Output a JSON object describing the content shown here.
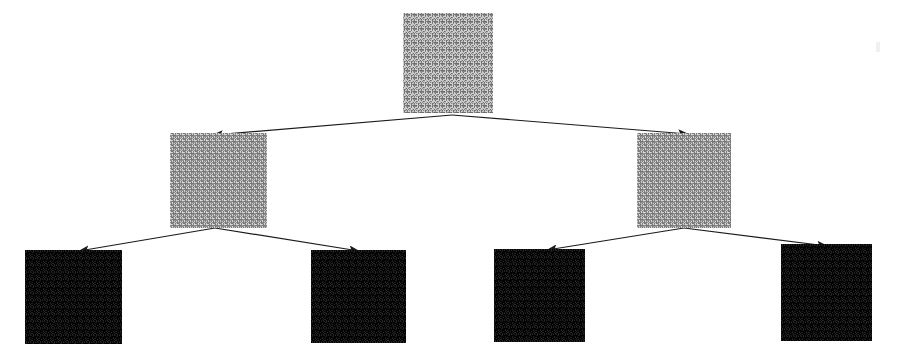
{
  "figure": {
    "kind": "binary-tree-diagram",
    "background_color": "#ffffff",
    "edge_color": "#1a1a1a",
    "canvas": {
      "width": 900,
      "height": 360
    }
  },
  "nodes": [
    {
      "id": "root",
      "role": "root",
      "level": 0,
      "label": "root-patch",
      "texture": "gray-noise",
      "fill_color": "#9a9a9a",
      "x": 403,
      "y": 13,
      "width": 90,
      "height": 100
    },
    {
      "id": "internal-left",
      "role": "internal",
      "level": 1,
      "label": "left-child-patch",
      "texture": "gray-noise",
      "fill_color": "#a6a6a6",
      "x": 170,
      "y": 133,
      "width": 97,
      "height": 95
    },
    {
      "id": "internal-right",
      "role": "internal",
      "level": 1,
      "label": "right-child-patch",
      "texture": "gray-noise",
      "fill_color": "#a6a6a6",
      "x": 637,
      "y": 133,
      "width": 94,
      "height": 95
    },
    {
      "id": "leaf-1",
      "role": "leaf",
      "level": 2,
      "label": "leaf-patch-1",
      "texture": "dark-noise",
      "fill_color": "#0d0d0d",
      "x": 25,
      "y": 250,
      "width": 97,
      "height": 94
    },
    {
      "id": "leaf-2",
      "role": "leaf",
      "level": 2,
      "label": "leaf-patch-2",
      "texture": "dark-noise",
      "fill_color": "#0d0d0d",
      "x": 311,
      "y": 250,
      "width": 95,
      "height": 93
    },
    {
      "id": "leaf-3",
      "role": "leaf",
      "level": 2,
      "label": "leaf-patch-3",
      "texture": "dark-noise",
      "fill_color": "#0d0d0d",
      "x": 494,
      "y": 249,
      "width": 91,
      "height": 93
    },
    {
      "id": "leaf-4",
      "role": "leaf",
      "level": 2,
      "label": "leaf-patch-4",
      "texture": "dark-noise",
      "fill_color": "#0d0d0d",
      "x": 781,
      "y": 244,
      "width": 91,
      "height": 97
    }
  ],
  "edges": [
    {
      "id": "edge-root-left",
      "from": "root",
      "to": "internal-left",
      "x1": 452,
      "y1": 115,
      "x2": 213,
      "y2": 135,
      "arrowhead": true
    },
    {
      "id": "edge-root-right",
      "from": "root",
      "to": "internal-right",
      "x1": 452,
      "y1": 115,
      "x2": 688,
      "y2": 134,
      "arrowhead": true
    },
    {
      "id": "edge-left-leaf1",
      "from": "internal-left",
      "to": "leaf-1",
      "x1": 215,
      "y1": 228,
      "x2": 79,
      "y2": 251,
      "arrowhead": true
    },
    {
      "id": "edge-left-leaf2",
      "from": "internal-left",
      "to": "leaf-2",
      "x1": 215,
      "y1": 228,
      "x2": 359,
      "y2": 251,
      "arrowhead": true
    },
    {
      "id": "edge-right-leaf3",
      "from": "internal-right",
      "to": "leaf-3",
      "x1": 684,
      "y1": 228,
      "x2": 547,
      "y2": 250,
      "arrowhead": true
    },
    {
      "id": "edge-right-leaf4",
      "from": "internal-right",
      "to": "leaf-4",
      "x1": 684,
      "y1": 228,
      "x2": 827,
      "y2": 246,
      "arrowhead": true
    }
  ],
  "artifacts": [
    {
      "id": "scan-mark-right",
      "x": 876,
      "y": 42,
      "width": 4,
      "height": 10,
      "color": "#f0f0f0"
    }
  ]
}
